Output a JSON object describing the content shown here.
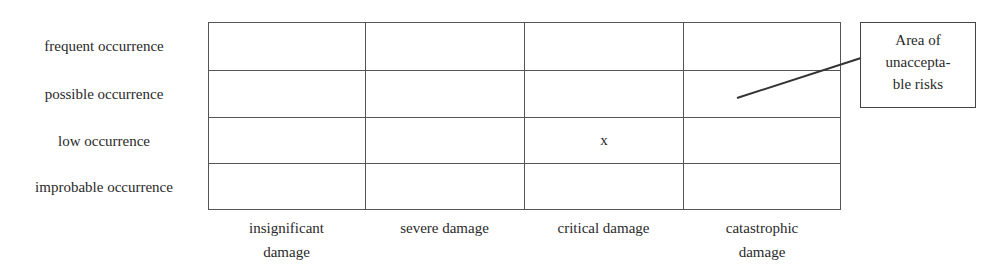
{
  "diagram": {
    "type": "risk-matrix",
    "row_labels": [
      "frequent occurrence",
      "possible occurrence",
      "low  occurrence",
      "improbable occurrence"
    ],
    "column_labels": [
      {
        "line1": "insignificant",
        "line2": "damage"
      },
      {
        "line1": "severe damage",
        "line2": ""
      },
      {
        "line1": "critical damage",
        "line2": ""
      },
      {
        "line1": "catastrophic",
        "line2": "damage"
      }
    ],
    "cells": [
      [
        "",
        "",
        "",
        ""
      ],
      [
        "",
        "",
        "",
        ""
      ],
      [
        "",
        "",
        "x",
        ""
      ],
      [
        "",
        "",
        "",
        ""
      ]
    ],
    "callout": {
      "line1": "Area of",
      "line2": "unaccepta-",
      "line3": "ble risks"
    }
  }
}
